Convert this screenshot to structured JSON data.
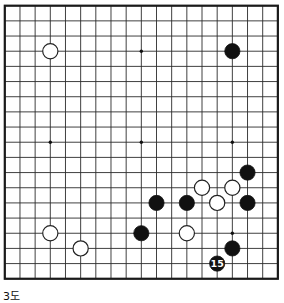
{
  "diagram": {
    "caption": "3도",
    "board": {
      "size": 19,
      "origin_x": 4.8,
      "origin_y": 5.7,
      "spacing": 15.17,
      "line_color": "#2b2b2b",
      "border_color": "#1a1a1a",
      "background_color": "#ffffff",
      "star_point_color": "#111111",
      "star_points": [
        {
          "col": 3,
          "row": 3
        },
        {
          "col": 9,
          "row": 3
        },
        {
          "col": 15,
          "row": 3
        },
        {
          "col": 3,
          "row": 9
        },
        {
          "col": 9,
          "row": 9
        },
        {
          "col": 15,
          "row": 9
        },
        {
          "col": 3,
          "row": 15
        },
        {
          "col": 9,
          "row": 15
        },
        {
          "col": 15,
          "row": 15
        }
      ]
    },
    "stone_style": {
      "radius": 7.6,
      "black_fill": "#111111",
      "black_stroke": "#111111",
      "white_fill": "#ffffff",
      "white_stroke": "#222222",
      "label_text_color": "#ffffff"
    },
    "stones": [
      {
        "color": "white",
        "col": 3,
        "row": 3,
        "label": ""
      },
      {
        "color": "black",
        "col": 15,
        "row": 3,
        "label": ""
      },
      {
        "color": "black",
        "col": 16,
        "row": 11,
        "label": ""
      },
      {
        "color": "white",
        "col": 13,
        "row": 12,
        "label": ""
      },
      {
        "color": "white",
        "col": 15,
        "row": 12,
        "label": ""
      },
      {
        "color": "black",
        "col": 10,
        "row": 13,
        "label": ""
      },
      {
        "color": "black",
        "col": 12,
        "row": 13,
        "label": ""
      },
      {
        "color": "white",
        "col": 14,
        "row": 13,
        "label": ""
      },
      {
        "color": "black",
        "col": 16,
        "row": 13,
        "label": ""
      },
      {
        "color": "white",
        "col": 3,
        "row": 15,
        "label": ""
      },
      {
        "color": "black",
        "col": 9,
        "row": 15,
        "label": ""
      },
      {
        "color": "white",
        "col": 12,
        "row": 15,
        "label": ""
      },
      {
        "color": "white",
        "col": 5,
        "row": 16,
        "label": ""
      },
      {
        "color": "black",
        "col": 15,
        "row": 16,
        "label": ""
      },
      {
        "color": "black",
        "col": 14,
        "row": 17,
        "label": "15"
      }
    ]
  }
}
